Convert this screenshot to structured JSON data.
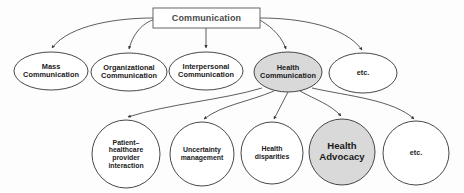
{
  "diagram": {
    "type": "tree",
    "background_color": "#fdfdfd",
    "stroke_color": "#333333",
    "shaded_fill": "#d9d9d9",
    "plain_fill": "#ffffff",
    "root": {
      "id": "communication",
      "label": "Communication",
      "shape": "rectangle",
      "x": 153,
      "y": 8,
      "width": 107,
      "height": 20,
      "filled": false
    },
    "level1": [
      {
        "id": "mass-communication",
        "label": "Mass\nCommunication",
        "shape": "ellipse",
        "cx": 51,
        "cy": 71,
        "rx": 37,
        "ry": 19,
        "filled": false
      },
      {
        "id": "organizational-communication",
        "label": "Organizational\nCommunication",
        "shape": "ellipse",
        "cx": 129,
        "cy": 72,
        "rx": 38,
        "ry": 19,
        "filled": false
      },
      {
        "id": "interpersonal-communication",
        "label": "Interpersonal\nCommunication",
        "shape": "ellipse",
        "cx": 206,
        "cy": 71,
        "rx": 37,
        "ry": 19,
        "filled": false
      },
      {
        "id": "health-communication",
        "label": "Health\nCommunication",
        "shape": "ellipse",
        "cx": 288,
        "cy": 72,
        "rx": 34,
        "ry": 20,
        "filled": true
      },
      {
        "id": "etc-level1",
        "label": "etc.",
        "shape": "ellipse",
        "cx": 363,
        "cy": 73,
        "rx": 34,
        "ry": 20,
        "filled": false
      }
    ],
    "level2": [
      {
        "id": "patient-healthcare-provider-interaction",
        "label": "Patient–\nhealthcare\nprovider\ninteraction",
        "shape": "circle",
        "cx": 126,
        "cy": 154,
        "rx": 34,
        "ry": 34,
        "filled": false,
        "emphasis": false
      },
      {
        "id": "uncertainty-management",
        "label": "Uncertainty\nmanagement",
        "shape": "circle",
        "cx": 202,
        "cy": 154,
        "rx": 32,
        "ry": 32,
        "filled": false,
        "emphasis": false
      },
      {
        "id": "health-disparities",
        "label": "Health\ndisparities",
        "shape": "circle",
        "cx": 272,
        "cy": 153,
        "rx": 31,
        "ry": 31,
        "filled": false,
        "emphasis": false
      },
      {
        "id": "health-advocacy",
        "label": "Health\nAdvocacy",
        "shape": "circle",
        "cx": 342,
        "cy": 152,
        "rx": 33,
        "ry": 33,
        "filled": true,
        "emphasis": true
      },
      {
        "id": "etc-level2",
        "label": "etc.",
        "shape": "circle",
        "cx": 416,
        "cy": 153,
        "rx": 33,
        "ry": 32,
        "filled": false,
        "emphasis": false
      }
    ],
    "edges": [
      {
        "id": "edge-root-mass",
        "from": "communication",
        "to": "mass-communication",
        "arrow": true
      },
      {
        "id": "edge-root-organizational",
        "from": "communication",
        "to": "organizational-communication",
        "arrow": true
      },
      {
        "id": "edge-root-interpersonal",
        "from": "communication",
        "to": "interpersonal-communication",
        "arrow": true
      },
      {
        "id": "edge-root-health",
        "from": "communication",
        "to": "health-communication",
        "arrow": true
      },
      {
        "id": "edge-root-etc",
        "from": "communication",
        "to": "etc-level1",
        "arrow": true
      },
      {
        "id": "edge-health-patient",
        "from": "health-communication",
        "to": "patient-healthcare-provider-interaction",
        "arrow": true
      },
      {
        "id": "edge-health-uncertainty",
        "from": "health-communication",
        "to": "uncertainty-management",
        "arrow": true
      },
      {
        "id": "edge-health-disparities",
        "from": "health-communication",
        "to": "health-disparities",
        "arrow": true
      },
      {
        "id": "edge-health-advocacy",
        "from": "health-communication",
        "to": "health-advocacy",
        "arrow": true
      },
      {
        "id": "edge-health-etc",
        "from": "health-communication",
        "to": "etc-level2",
        "arrow": true
      }
    ]
  }
}
